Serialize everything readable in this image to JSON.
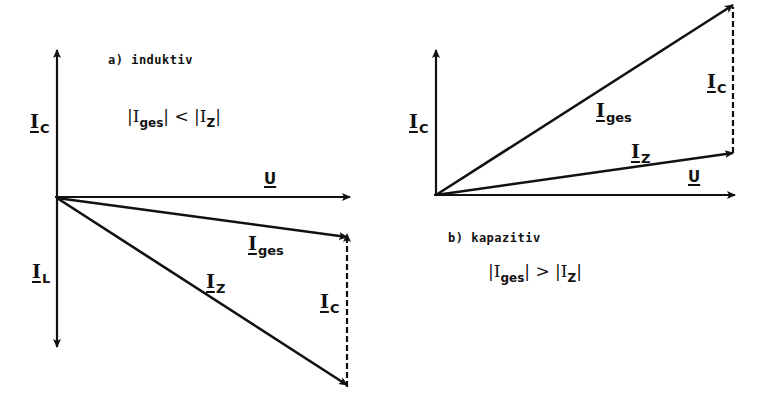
{
  "panel_a": {
    "title": "a) induktiv",
    "relation": {
      "left_sym": "I",
      "left_sub": "ges",
      "operator": "<",
      "right_sym": "I",
      "right_sub": "Z"
    },
    "labels": {
      "ic_axis": {
        "sym": "I",
        "sub": "C"
      },
      "il_axis": {
        "sym": "I",
        "sub": "L"
      },
      "u": "U",
      "iges": {
        "sym": "I",
        "sub": "ges"
      },
      "iz": {
        "sym": "I",
        "sub": "Z"
      },
      "ic_dashed": {
        "sym": "I",
        "sub": "C"
      }
    }
  },
  "panel_b": {
    "title": "b) kapazitiv",
    "relation": {
      "left_sym": "I",
      "left_sub": "ges",
      "operator": ">",
      "right_sym": "I",
      "right_sub": "Z"
    },
    "labels": {
      "ic_axis": {
        "sym": "I",
        "sub": "C"
      },
      "u": "U",
      "iges": {
        "sym": "I",
        "sub": "ges"
      },
      "iz": {
        "sym": "I",
        "sub": "Z"
      },
      "ic_dashed": {
        "sym": "I",
        "sub": "C"
      }
    }
  },
  "colors": {
    "ink": "#111111",
    "background": "#ffffff"
  }
}
